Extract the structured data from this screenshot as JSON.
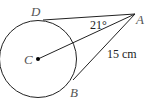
{
  "diagram": {
    "type": "geometry-tangent-lines",
    "points": {
      "C": {
        "label": "C",
        "role": "circle-center"
      },
      "A": {
        "label": "A",
        "role": "external-point"
      },
      "D": {
        "label": "D",
        "role": "tangent-point"
      },
      "B": {
        "label": "B",
        "role": "tangent-point"
      }
    },
    "angle_label": "21°",
    "length_label": "15 cm",
    "colors": {
      "stroke": "#222222",
      "label": "#555555"
    }
  }
}
